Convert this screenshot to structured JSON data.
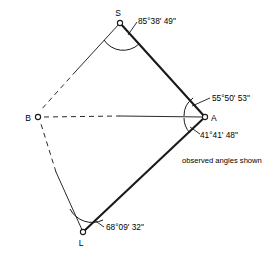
{
  "figure": {
    "caption": "observed angles shown",
    "ink_color": "#1a1a1a",
    "background_color": "#ffffff"
  },
  "stations": [
    {
      "id": "S",
      "label": "S",
      "x": 120,
      "y": 23,
      "label_x": 118,
      "label_y": 16
    },
    {
      "id": "A",
      "label": "A",
      "x": 205,
      "y": 117,
      "label_x": 212,
      "label_y": 120
    },
    {
      "id": "L",
      "label": "L",
      "x": 83,
      "y": 232,
      "label_x": 80,
      "label_y": 245
    },
    {
      "id": "B",
      "label": "B",
      "x": 38,
      "y": 117,
      "label_x": 22,
      "label_y": 121
    }
  ],
  "observed_angles": [
    {
      "at_station": "S",
      "text": "85°38' 49\"",
      "degrees": 85,
      "minutes": 38,
      "seconds": 49,
      "label_x": 137,
      "label_y": 24
    },
    {
      "at_station": "A",
      "position": "upper",
      "text": "55°50' 53\"",
      "degrees": 55,
      "minutes": 50,
      "seconds": 53,
      "label_x": 210,
      "label_y": 101
    },
    {
      "at_station": "A",
      "position": "lower",
      "text": "41°41' 48\"",
      "degrees": 41,
      "minutes": 41,
      "seconds": 48,
      "label_x": 199,
      "label_y": 137
    },
    {
      "at_station": "L",
      "text": "68°09' 32\"",
      "degrees": 68,
      "minutes": 9,
      "seconds": 32,
      "label_x": 103,
      "label_y": 230
    }
  ],
  "caption": {
    "text": "observed angles shown",
    "x": 182,
    "y": 160
  }
}
